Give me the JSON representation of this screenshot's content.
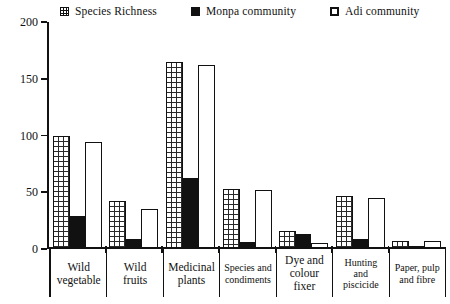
{
  "chart_data": {
    "type": "bar",
    "title": "",
    "xlabel": "",
    "ylabel": "",
    "ylim": [
      0,
      200
    ],
    "yticks": [
      "0",
      "50",
      "100",
      "150",
      "200"
    ],
    "grid": false,
    "legend_position": "top",
    "categories": [
      "Wild vegetable",
      "Wild fruits",
      "Medicinal plants",
      "Species and condiments",
      "Dye and colour fixer",
      "Hunting and piscicide",
      "Paper, pulp and fibre"
    ],
    "category_lines": [
      [
        "Wild",
        "vegetable"
      ],
      [
        "Wild",
        "fruits"
      ],
      [
        "Medicinal",
        "plants"
      ],
      [
        "Species and",
        "condiments"
      ],
      [
        "Dye and",
        "colour",
        "fixer"
      ],
      [
        "Hunting",
        "and",
        "piscicide"
      ],
      [
        "Paper, pulp",
        "and fibre"
      ]
    ],
    "series": [
      {
        "name": "Species Richness",
        "marker": "crosshatch-square",
        "color": "#ffffff",
        "values": [
          100,
          42,
          165,
          53,
          16,
          47,
          7
        ]
      },
      {
        "name": "Monpa community",
        "marker": "filled-square",
        "color": "#111111",
        "values": [
          29,
          9,
          63,
          6,
          13,
          9,
          3
        ]
      },
      {
        "name": "Adi community",
        "marker": "outlined-square",
        "color": "#ffffff",
        "values": [
          94,
          35,
          162,
          52,
          5,
          45,
          7
        ]
      }
    ]
  },
  "legend": {
    "items": [
      {
        "label": "Species Richness"
      },
      {
        "label": "Monpa community"
      },
      {
        "label": "Adi community"
      }
    ]
  }
}
